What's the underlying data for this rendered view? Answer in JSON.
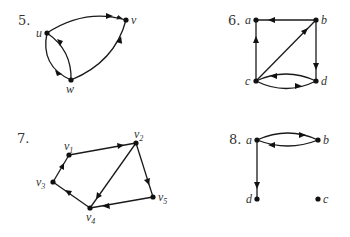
{
  "colors": {
    "ink": "#1a1a1a",
    "background": "#ffffff"
  },
  "graphs": [
    {
      "number": "5.",
      "nodes": [
        {
          "id": "u",
          "label": "u"
        },
        {
          "id": "v",
          "label": "v"
        },
        {
          "id": "w",
          "label": "w"
        }
      ],
      "edges": [
        {
          "from": "u",
          "to": "v"
        },
        {
          "from": "w",
          "to": "v"
        },
        {
          "from": "u",
          "to": "w"
        },
        {
          "from": "w",
          "to": "u"
        }
      ]
    },
    {
      "number": "6.",
      "nodes": [
        {
          "id": "a",
          "label": "a"
        },
        {
          "id": "b",
          "label": "b"
        },
        {
          "id": "c",
          "label": "c"
        },
        {
          "id": "d",
          "label": "d"
        }
      ],
      "edges": [
        {
          "from": "b",
          "to": "a"
        },
        {
          "from": "c",
          "to": "a"
        },
        {
          "from": "c",
          "to": "b"
        },
        {
          "from": "b",
          "to": "d"
        },
        {
          "from": "d",
          "to": "c"
        },
        {
          "from": "c",
          "to": "d"
        }
      ]
    },
    {
      "number": "7.",
      "nodes": [
        {
          "id": "v1",
          "label": "v",
          "sub": "1"
        },
        {
          "id": "v2",
          "label": "v",
          "sub": "2"
        },
        {
          "id": "v3",
          "label": "v",
          "sub": "3"
        },
        {
          "id": "v4",
          "label": "v",
          "sub": "4"
        },
        {
          "id": "v5",
          "label": "v",
          "sub": "5"
        }
      ],
      "edges": [
        {
          "from": "v1",
          "to": "v2"
        },
        {
          "from": "v2",
          "to": "v4"
        },
        {
          "from": "v2",
          "to": "v5"
        },
        {
          "from": "v5",
          "to": "v4"
        },
        {
          "from": "v4",
          "to": "v3"
        },
        {
          "from": "v3",
          "to": "v1"
        }
      ]
    },
    {
      "number": "8.",
      "nodes": [
        {
          "id": "a",
          "label": "a"
        },
        {
          "id": "b",
          "label": "b"
        },
        {
          "id": "c",
          "label": "c"
        },
        {
          "id": "d",
          "label": "d"
        }
      ],
      "edges": [
        {
          "from": "a",
          "to": "b"
        },
        {
          "from": "b",
          "to": "a"
        },
        {
          "from": "a",
          "to": "d"
        }
      ]
    }
  ]
}
